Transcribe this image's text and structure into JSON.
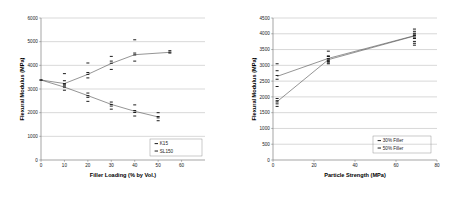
{
  "figure": {
    "background": "#ffffff",
    "marker_color": "#111111",
    "line_color": "#4d4d4d",
    "grid_color": "#b0b0b0"
  },
  "chart_data": [
    {
      "id": "left",
      "type": "scatter",
      "title": "",
      "xlabel": "Filler Loading (% by Vol.)",
      "ylabel": "Flexural Modulus (MPa)",
      "xlim": [
        0,
        70
      ],
      "ylim": [
        0,
        6000
      ],
      "xticks": [
        0,
        10,
        20,
        30,
        40,
        50,
        60
      ],
      "yticks": [
        0,
        1000,
        2000,
        3000,
        4000,
        5000,
        6000
      ],
      "grid": true,
      "legend_position": "lower-right",
      "series": [
        {
          "name": "K15",
          "marker": "dash",
          "trend_x": [
            0,
            10,
            20,
            30,
            40,
            55
          ],
          "trend_y": [
            3380,
            3230,
            3620,
            4080,
            4450,
            4550
          ],
          "points": [
            {
              "x": 0,
              "y": 3380
            },
            {
              "x": 10,
              "y": 3350
            },
            {
              "x": 10,
              "y": 3230
            },
            {
              "x": 10,
              "y": 3130
            },
            {
              "x": 20,
              "y": 4100
            },
            {
              "x": 20,
              "y": 3700
            },
            {
              "x": 20,
              "y": 3620
            },
            {
              "x": 20,
              "y": 3470
            },
            {
              "x": 30,
              "y": 4380
            },
            {
              "x": 30,
              "y": 4180
            },
            {
              "x": 30,
              "y": 4090
            },
            {
              "x": 30,
              "y": 3830
            },
            {
              "x": 40,
              "y": 5080
            },
            {
              "x": 40,
              "y": 4520
            },
            {
              "x": 40,
              "y": 4440
            },
            {
              "x": 40,
              "y": 4180
            },
            {
              "x": 55,
              "y": 4620
            },
            {
              "x": 55,
              "y": 4560
            },
            {
              "x": 55,
              "y": 4520
            }
          ]
        },
        {
          "name": "SL150",
          "marker": "dash",
          "trend_x": [
            0,
            10,
            20,
            30,
            40,
            50
          ],
          "trend_y": [
            3380,
            3080,
            2720,
            2350,
            2060,
            1820
          ],
          "points": [
            {
              "x": 0,
              "y": 3380
            },
            {
              "x": 10,
              "y": 3650
            },
            {
              "x": 10,
              "y": 3180
            },
            {
              "x": 10,
              "y": 3080
            },
            {
              "x": 10,
              "y": 2950
            },
            {
              "x": 20,
              "y": 2830
            },
            {
              "x": 20,
              "y": 2720
            },
            {
              "x": 20,
              "y": 2650
            },
            {
              "x": 20,
              "y": 2480
            },
            {
              "x": 30,
              "y": 2450
            },
            {
              "x": 30,
              "y": 2350
            },
            {
              "x": 30,
              "y": 2280
            },
            {
              "x": 30,
              "y": 2150
            },
            {
              "x": 40,
              "y": 2330
            },
            {
              "x": 40,
              "y": 2090
            },
            {
              "x": 40,
              "y": 2010
            },
            {
              "x": 40,
              "y": 1860
            },
            {
              "x": 50,
              "y": 2000
            },
            {
              "x": 50,
              "y": 1840
            },
            {
              "x": 50,
              "y": 1780
            },
            {
              "x": 50,
              "y": 1660
            }
          ]
        }
      ]
    },
    {
      "id": "right",
      "type": "scatter",
      "title": "",
      "xlabel": "Particle Strength (MPa)",
      "ylabel": "Flexural Modulus (MPa)",
      "xlim": [
        0,
        80
      ],
      "ylim": [
        0,
        4500
      ],
      "xticks": [
        0,
        20,
        40,
        60,
        80
      ],
      "yticks": [
        0,
        500,
        1000,
        1500,
        2000,
        2500,
        3000,
        3500,
        4000,
        4500
      ],
      "grid": true,
      "legend_position": "lower-right",
      "series": [
        {
          "name": "30% Filler",
          "marker": "dash",
          "trend_x": [
            2,
            27,
            69
          ],
          "trend_y": [
            2650,
            3220,
            3940
          ],
          "points": [
            {
              "x": 2,
              "y": 3050
            },
            {
              "x": 2,
              "y": 2830
            },
            {
              "x": 2,
              "y": 2680
            },
            {
              "x": 2,
              "y": 2560
            },
            {
              "x": 2,
              "y": 2330
            },
            {
              "x": 27,
              "y": 3450
            },
            {
              "x": 27,
              "y": 3280
            },
            {
              "x": 27,
              "y": 3210
            },
            {
              "x": 27,
              "y": 3120
            },
            {
              "x": 27,
              "y": 3050
            },
            {
              "x": 69,
              "y": 4150
            },
            {
              "x": 69,
              "y": 4020
            },
            {
              "x": 69,
              "y": 3950
            },
            {
              "x": 69,
              "y": 3870
            },
            {
              "x": 69,
              "y": 3760
            },
            {
              "x": 69,
              "y": 3640
            }
          ]
        },
        {
          "name": "50% Filler",
          "marker": "dash",
          "trend_x": [
            2,
            27,
            69
          ],
          "trend_y": [
            1850,
            3180,
            3930
          ],
          "points": [
            {
              "x": 2,
              "y": 1950
            },
            {
              "x": 2,
              "y": 1880
            },
            {
              "x": 2,
              "y": 1840
            },
            {
              "x": 2,
              "y": 1780
            },
            {
              "x": 2,
              "y": 1700
            },
            {
              "x": 27,
              "y": 3300
            },
            {
              "x": 27,
              "y": 3200
            },
            {
              "x": 27,
              "y": 3150
            },
            {
              "x": 27,
              "y": 3080
            },
            {
              "x": 69,
              "y": 4080
            },
            {
              "x": 69,
              "y": 3990
            },
            {
              "x": 69,
              "y": 3930
            },
            {
              "x": 69,
              "y": 3850
            },
            {
              "x": 69,
              "y": 3700
            }
          ]
        }
      ]
    }
  ]
}
